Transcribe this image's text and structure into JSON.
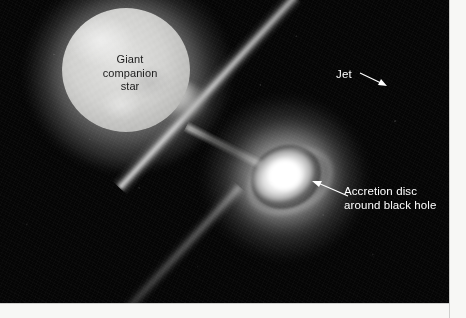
{
  "figure": {
    "kind": "astronomical-illustration",
    "background_color": "#050505",
    "margin_color": "#f7f7f5"
  },
  "objects": {
    "companion_star": {
      "name": "Giant companion star",
      "color": "#d2d2d0",
      "position": "upper-left"
    },
    "accretion_stream": {
      "name": "accretion stream",
      "color": "#c6c6c4"
    },
    "accretion_disc": {
      "name": "Accretion disc around black hole",
      "color": "#ffffff",
      "position": "center-right"
    },
    "jet": {
      "name": "Jet",
      "color": "#ffffff",
      "orientation": "north-east to south-west diagonal"
    }
  },
  "labels": {
    "star": {
      "line1": "Giant",
      "line2": "companion",
      "line3": "star",
      "color": "#1b1b1b"
    },
    "jet": {
      "text": "Jet",
      "color": "#ffffff"
    },
    "disc": {
      "line1": "Accretion disc",
      "line2": "around black hole",
      "color": "#ffffff"
    }
  }
}
